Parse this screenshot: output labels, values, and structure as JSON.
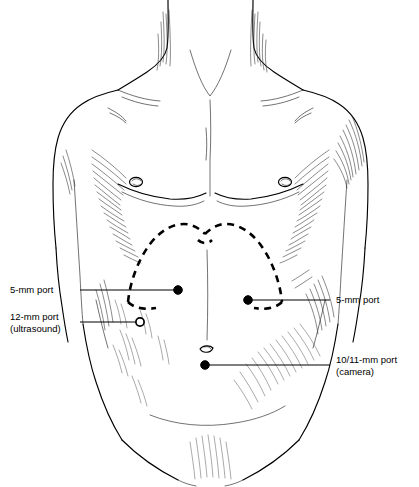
{
  "figure": {
    "background_color": "#ffffff",
    "ink_color": "#000000",
    "width": 419,
    "height": 487
  },
  "annotations": [
    {
      "id": "port-5mm-left",
      "line1": "5-mm port",
      "line2": "",
      "side": "left",
      "marker": "filled-dot",
      "marker_x": 178,
      "marker_y": 290,
      "text_x": 10,
      "text_y": 293,
      "leader_from_x": 80,
      "leader_to_x": 178,
      "leader_y": 290
    },
    {
      "id": "port-12mm-ultrasound",
      "line1": "12-mm port",
      "line2": "(ultrasound)",
      "side": "left",
      "marker": "open-circle",
      "marker_x": 140,
      "marker_y": 322,
      "text_x": 10,
      "text_y": 320,
      "leader_from_x": 80,
      "leader_to_x": 136,
      "leader_y": 322
    },
    {
      "id": "port-5mm-right",
      "line1": "5-mm port",
      "line2": "",
      "side": "right",
      "marker": "filled-dot",
      "marker_x": 248,
      "marker_y": 300,
      "text_x": 336,
      "text_y": 303,
      "leader_from_x": 252,
      "leader_to_x": 330,
      "leader_y": 300
    },
    {
      "id": "port-1011mm-camera",
      "line1": "10/11-mm port",
      "line2": "(camera)",
      "side": "right",
      "marker": "filled-dot",
      "marker_x": 205,
      "marker_y": 365,
      "text_x": 336,
      "text_y": 363,
      "leader_from_x": 209,
      "leader_to_x": 330,
      "leader_y": 365
    }
  ],
  "landmarks": {
    "costal_margin_label": "costal margin (dashed outline)",
    "umbilicus_label": "umbilicus",
    "nipple_left_label": "left nipple",
    "nipple_right_label": "right nipple",
    "suprasternal_notch_label": "suprasternal notch"
  }
}
